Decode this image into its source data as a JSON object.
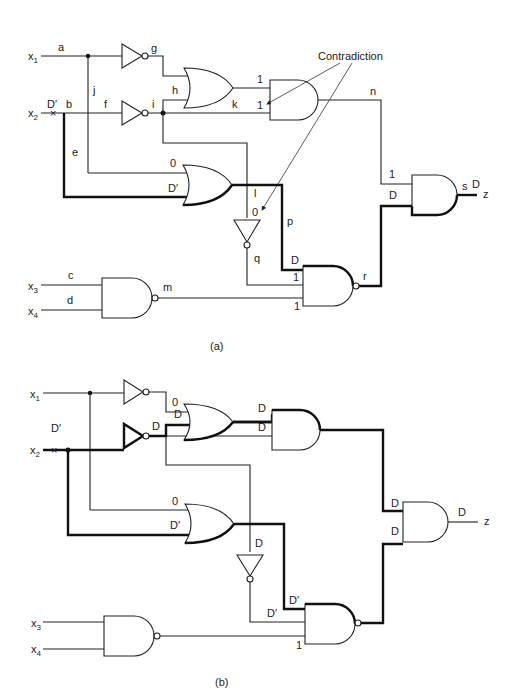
{
  "figure": {
    "panels": [
      {
        "id": "a",
        "caption": "(a)",
        "inputs": [
          "x1",
          "x2",
          "x3",
          "x4"
        ],
        "output": "z",
        "fault_marker": "x",
        "fault_value": "D′",
        "signal_labels": {
          "a": "a",
          "b": "b",
          "c": "c",
          "d": "d",
          "e": "e",
          "f": "f",
          "g": "g",
          "h": "h",
          "i": "i",
          "j": "j",
          "k": "k",
          "l": "l",
          "m": "m",
          "n": "n",
          "p": "p",
          "q": "q",
          "r": "r",
          "s": "s"
        },
        "values": {
          "x2_fault": "D′",
          "or1_in_top": "1",
          "and1_in_top": "1",
          "and1_in_bot": "1",
          "or2_in_top": "0",
          "or2_in_bot": "D′",
          "not_l_in": "0",
          "nand_in_p": "D",
          "nand_in_q": "1",
          "nand_in_m": "1",
          "and_final_in_n": "1",
          "and_final_in_r": "D",
          "output_s": "D"
        },
        "annotation": "Contradiction"
      },
      {
        "id": "b",
        "caption": "(b)",
        "inputs": [
          "x1",
          "x2",
          "x3",
          "x4"
        ],
        "output": "z",
        "fault_marker": "x",
        "fault_value": "D′",
        "values": {
          "not_g_out": "0",
          "not_i_out": "D",
          "or1_in_bot": "D",
          "or1_out": "D",
          "and1_in_bot": "D",
          "or2_in_top": "0",
          "or2_in_bot": "D′",
          "not_l_in": "D",
          "nand_in_p": "D′",
          "nand_in_q": "D′",
          "nand_in_m": "1",
          "and_final_in_top": "D",
          "and_final_in_bot": "D",
          "output": "D"
        }
      }
    ]
  }
}
